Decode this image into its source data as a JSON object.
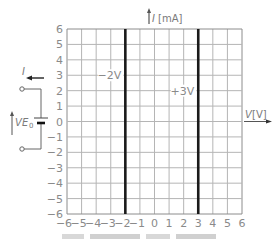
{
  "chart_data": {
    "type": "line",
    "title": "",
    "xlabel": "V [V]",
    "ylabel": "I [mA]",
    "xlim": [
      -6,
      6
    ],
    "ylim": [
      -6,
      6
    ],
    "grid": true,
    "x_ticks": [
      -6,
      -5,
      -4,
      -3,
      -2,
      -1,
      0,
      1,
      2,
      3,
      4,
      5,
      6
    ],
    "y_ticks": [
      6,
      5,
      4,
      3,
      2,
      1,
      0,
      -1,
      -2,
      -3,
      -4,
      -5,
      -6
    ],
    "series": [
      {
        "name": "-2V",
        "x": [
          -2,
          -2
        ],
        "y": [
          -6,
          6
        ],
        "label_at_y": 3
      },
      {
        "name": "+3V",
        "x": [
          3,
          3
        ],
        "y": [
          -6,
          6
        ],
        "label_at_y": 2
      }
    ],
    "annotations": [
      "-2V",
      "+3V"
    ]
  },
  "axes": {
    "y_label_italic": "I",
    "y_label_unit": "[mA]",
    "x_label_italic": "V",
    "x_label_unit": "[V]"
  },
  "circuit": {
    "current_label": "I",
    "voltage_label": "V",
    "source_label": "E",
    "source_subscript": "0"
  },
  "colors": {
    "grid": "#b5b5b5",
    "frame": "#8c8c8c",
    "line": "#1a1a1a",
    "text": "#8a8a8a"
  }
}
